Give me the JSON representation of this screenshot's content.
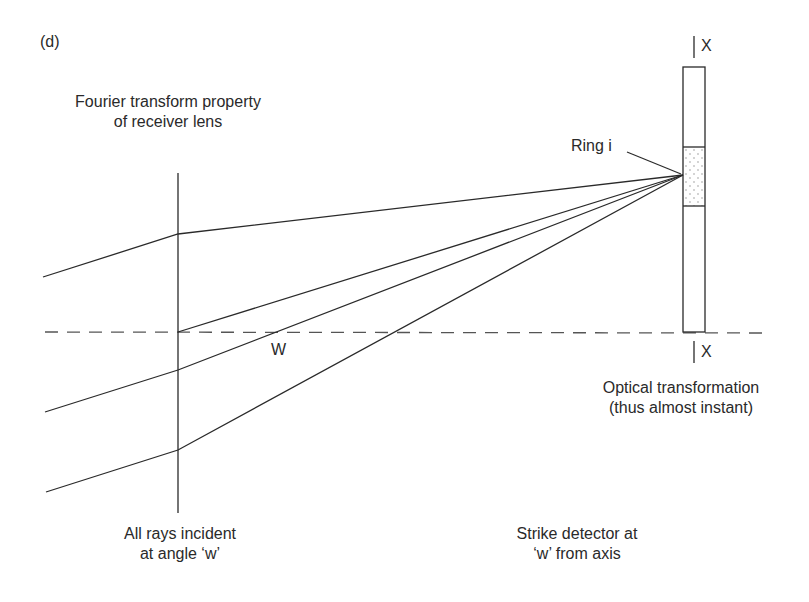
{
  "panel_label": "(d)",
  "labels": {
    "lens_title_line1": "Fourier transform property",
    "lens_title_line2": "of receiver lens",
    "ring": "Ring i",
    "axis_point": "W",
    "section_top": "X",
    "section_bottom": "X",
    "optical_line1": "Optical transformation",
    "optical_line2": "(thus almost instant)",
    "rays_line1": "All rays incident",
    "rays_line2": "at angle ‘w’",
    "strike_line1": "Strike detector at",
    "strike_line2": "‘w’ from axis"
  },
  "colors": {
    "line": "#2a2a2a",
    "axis": "#555555",
    "dots": "#888888"
  }
}
